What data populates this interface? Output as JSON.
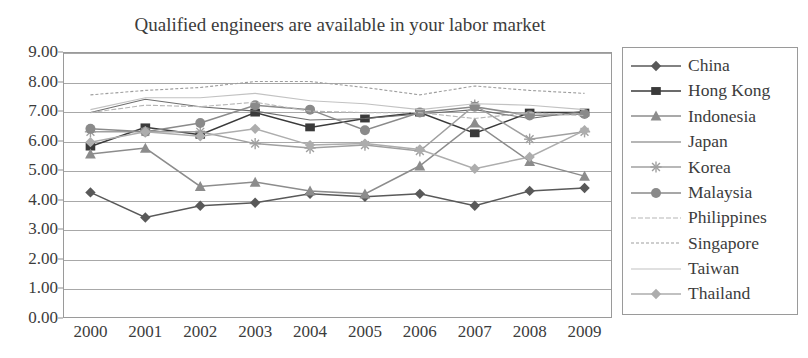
{
  "chart_data": {
    "type": "line",
    "title": "Qualified engineers are available in your labor market",
    "xlabel": "",
    "ylabel": "",
    "ylim": [
      0,
      9
    ],
    "ytick_step": 1,
    "grid": true,
    "legend_position": "right",
    "categories": [
      "2000",
      "2001",
      "2002",
      "2003",
      "2004",
      "2005",
      "2006",
      "2007",
      "2008",
      "2009"
    ],
    "ytick_labels": [
      "9.00",
      "8.00",
      "7.00",
      "6.00",
      "5.00",
      "4.00",
      "3.00",
      "2.00",
      "1.00",
      "0.00"
    ],
    "series": [
      {
        "name": "China",
        "marker": "diamond",
        "color": "#595959",
        "values": [
          4.25,
          3.4,
          3.8,
          3.9,
          4.2,
          4.1,
          4.2,
          3.8,
          4.3,
          4.4
        ]
      },
      {
        "name": "Hong Kong",
        "marker": "square",
        "color": "#3a3a3a",
        "values": [
          5.8,
          6.45,
          6.2,
          6.95,
          6.45,
          6.75,
          6.95,
          6.25,
          6.95,
          6.95
        ]
      },
      {
        "name": "Indonesia",
        "marker": "triangle",
        "color": "#8c8c8c",
        "values": [
          5.55,
          5.75,
          4.45,
          4.6,
          4.3,
          4.2,
          5.15,
          6.6,
          5.3,
          4.8
        ]
      },
      {
        "name": "Japan",
        "marker": "none",
        "color": "#6e6e6e",
        "values": [
          6.95,
          7.4,
          7.15,
          7.0,
          6.7,
          6.75,
          6.9,
          7.05,
          6.75,
          7.0
        ]
      },
      {
        "name": "Korea",
        "marker": "cross",
        "color": "#a0a0a0",
        "values": [
          6.3,
          6.3,
          6.3,
          5.9,
          5.75,
          5.85,
          5.65,
          7.2,
          6.05,
          6.3
        ]
      },
      {
        "name": "Malaysia",
        "marker": "circle",
        "color": "#8a8a8a",
        "values": [
          6.4,
          6.3,
          6.6,
          7.2,
          7.05,
          6.35,
          6.95,
          7.15,
          6.85,
          6.9
        ]
      },
      {
        "name": "Philippines",
        "marker": "none",
        "color": "#b5b5b5",
        "values": [
          6.95,
          7.2,
          7.15,
          7.3,
          7.0,
          6.95,
          6.95,
          6.75,
          6.95,
          6.85
        ]
      },
      {
        "name": "Singapore",
        "marker": "none",
        "color": "#9e9e9e",
        "values": [
          7.55,
          7.7,
          7.8,
          8.0,
          8.0,
          7.8,
          7.55,
          7.85,
          7.7,
          7.6
        ]
      },
      {
        "name": "Taiwan",
        "marker": "none",
        "color": "#c2c2c2",
        "values": [
          7.05,
          7.45,
          7.45,
          7.6,
          7.35,
          7.25,
          7.05,
          7.25,
          7.2,
          7.05
        ]
      },
      {
        "name": "Thailand",
        "marker": "diamond",
        "color": "#adadad",
        "values": [
          5.95,
          6.3,
          6.15,
          6.4,
          5.85,
          5.9,
          5.7,
          5.05,
          5.45,
          6.35
        ]
      }
    ]
  }
}
